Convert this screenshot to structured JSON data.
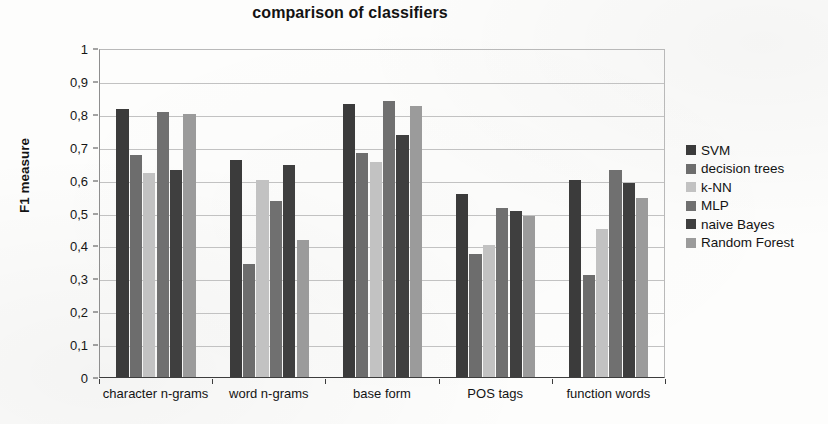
{
  "chart_data": {
    "type": "bar",
    "title": "comparison of classifiers",
    "xlabel": "",
    "ylabel": "F1 measure",
    "ylim": [
      0,
      1
    ],
    "ytick_labels": [
      "0",
      "0,1",
      "0,2",
      "0,3",
      "0,4",
      "0,5",
      "0,6",
      "0,7",
      "0,8",
      "0,9",
      "1"
    ],
    "ytick_values": [
      0,
      0.1,
      0.2,
      0.3,
      0.4,
      0.5,
      0.6,
      0.7,
      0.8,
      0.9,
      1
    ],
    "grid": true,
    "legend_position": "right",
    "categories": [
      "character n-grams",
      "word n-grams",
      "base form",
      "POS tags",
      "function words"
    ],
    "series": [
      {
        "name": "SVM",
        "color": "#3b3b3b",
        "values": [
          0.815,
          0.66,
          0.83,
          0.555,
          0.6
        ]
      },
      {
        "name": "decision trees",
        "color": "#6d6d6d",
        "values": [
          0.675,
          0.345,
          0.68,
          0.375,
          0.31
        ]
      },
      {
        "name": "k-NN",
        "color": "#c2c2c2",
        "values": [
          0.62,
          0.6,
          0.655,
          0.4,
          0.45
        ]
      },
      {
        "name": "MLP",
        "color": "#707070",
        "values": [
          0.805,
          0.535,
          0.84,
          0.515,
          0.63
        ]
      },
      {
        "name": "naive Bayes",
        "color": "#3f3f3f",
        "values": [
          0.63,
          0.645,
          0.735,
          0.505,
          0.59
        ]
      },
      {
        "name": "Random Forest",
        "color": "#9b9b9b",
        "values": [
          0.8,
          0.415,
          0.825,
          0.49,
          0.545
        ]
      }
    ]
  },
  "legend": {
    "items": [
      {
        "label": "SVM"
      },
      {
        "label": "decision trees"
      },
      {
        "label": "k-NN"
      },
      {
        "label": "MLP"
      },
      {
        "label": "naive Bayes"
      },
      {
        "label": "Random Forest"
      }
    ]
  }
}
